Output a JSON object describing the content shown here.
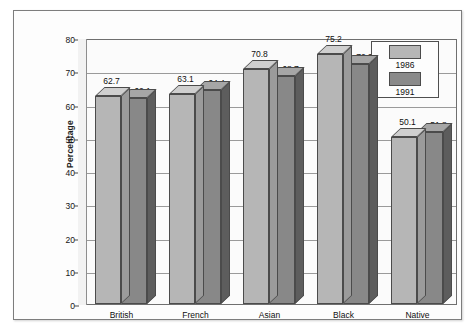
{
  "chart_data": {
    "type": "bar",
    "title": "",
    "xlabel": "",
    "ylabel": "Percentage",
    "ylim": [
      0,
      80
    ],
    "yticks": [
      0,
      10,
      20,
      30,
      40,
      50,
      60,
      70,
      80
    ],
    "grid": true,
    "legend_position": "top-right",
    "categories": [
      "British",
      "French",
      "Asian",
      "Black",
      "Native"
    ],
    "series": [
      {
        "name": "1986",
        "color": "#b6b6b6",
        "values": [
          62.7,
          63.1,
          70.8,
          75.2,
          50.1
        ]
      },
      {
        "name": "1991",
        "color": "#888888",
        "values": [
          62.1,
          64.4,
          68.7,
          72.3,
          51.8
        ]
      }
    ]
  },
  "legend": {
    "items": [
      {
        "label": "1986",
        "swatch": "light"
      },
      {
        "label": "1991",
        "swatch": "dark"
      }
    ]
  }
}
